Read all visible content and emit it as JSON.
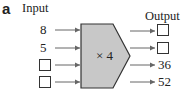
{
  "figure_label": "a",
  "headers": {
    "input": "Input",
    "output": "Output"
  },
  "machine": {
    "operation": "× 4",
    "fill": "#c8c8c8",
    "stroke": "#333333"
  },
  "rows": [
    {
      "input": "8",
      "output": ""
    },
    {
      "input": "5",
      "output": ""
    },
    {
      "input": "",
      "output": "36"
    },
    {
      "input": "",
      "output": "52"
    }
  ]
}
